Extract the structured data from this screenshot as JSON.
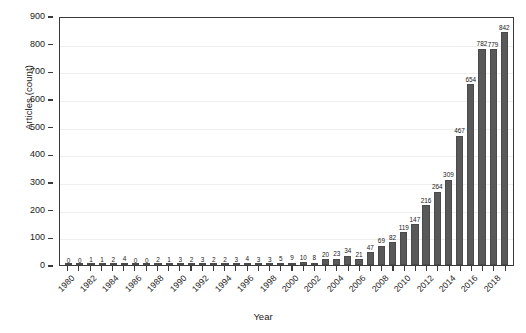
{
  "chart_data": {
    "type": "bar",
    "title": "",
    "xlabel": "Year",
    "ylabel": "Articles (count)",
    "ylim": [
      0,
      900
    ],
    "ytick_labels": [
      "0",
      "100",
      "200",
      "300",
      "400",
      "500",
      "600",
      "700",
      "800",
      "900"
    ],
    "ytick_values": [
      0,
      100,
      200,
      300,
      400,
      500,
      600,
      700,
      800,
      900
    ],
    "grid": "horizontal",
    "legend": "none",
    "bar_color": "#595959",
    "categories": [
      "1980",
      "1981",
      "1982",
      "1983",
      "1984",
      "1985",
      "1986",
      "1987",
      "1988",
      "1989",
      "1990",
      "1991",
      "1992",
      "1993",
      "1994",
      "1995",
      "1996",
      "1997",
      "1998",
      "1999",
      "2000",
      "2001",
      "2002",
      "2003",
      "2004",
      "2005",
      "2006",
      "2007",
      "2008",
      "2009",
      "2010",
      "2011",
      "2012",
      "2013",
      "2014",
      "2015",
      "2016",
      "2017",
      "2018",
      "2019"
    ],
    "xtick_labels": [
      "1980",
      "",
      "1982",
      "",
      "1984",
      "",
      "1986",
      "",
      "1988",
      "",
      "1990",
      "",
      "1992",
      "",
      "1994",
      "",
      "1996",
      "",
      "1998",
      "",
      "2000",
      "",
      "2002",
      "",
      "2004",
      "",
      "2006",
      "",
      "2008",
      "",
      "2010",
      "",
      "2012",
      "",
      "2014",
      "",
      "2016",
      "",
      "2018",
      ""
    ],
    "values": [
      0,
      0,
      1,
      1,
      2,
      4,
      0,
      0,
      2,
      1,
      3,
      2,
      3,
      2,
      2,
      3,
      4,
      3,
      3,
      5,
      9,
      10,
      8,
      20,
      23,
      34,
      21,
      47,
      69,
      82,
      119,
      147,
      216,
      264,
      309,
      467,
      654,
      782,
      779,
      842
    ],
    "value_labels": [
      "0",
      "0",
      "1",
      "1",
      "2",
      "4",
      "0",
      "0",
      "2",
      "1",
      "3",
      "2",
      "3",
      "2",
      "2",
      "3",
      "4",
      "3",
      "3",
      "5",
      "9",
      "10",
      "8",
      "20",
      "23",
      "34",
      "21",
      "47",
      "69",
      "82",
      "119",
      "147",
      "216",
      "264",
      "309",
      "467",
      "654",
      "782",
      "779",
      "842"
    ]
  }
}
